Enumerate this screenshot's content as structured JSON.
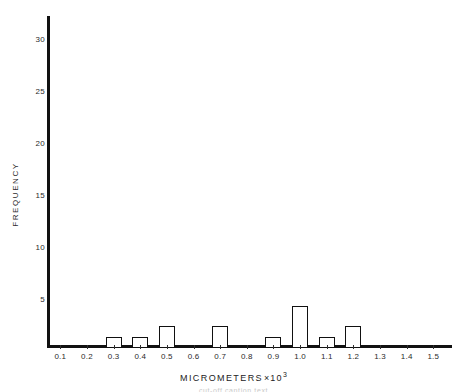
{
  "chart_data": {
    "type": "bar",
    "title": "",
    "subtitle": "",
    "xlabel": "MICROMETERS",
    "xlabel_multiplier": "×",
    "xlabel_exponent_base": "10",
    "xlabel_exponent": "3",
    "ylabel": "FREQUENCY",
    "categories": [
      "0.1",
      "0.2",
      "0.3",
      "0.4",
      "0.5",
      "0.6",
      "0.7",
      "0.8",
      "0.9",
      "1.0",
      "1.1",
      "1.2",
      "1.3",
      "1.4",
      "1.5"
    ],
    "values": [
      0,
      0,
      1,
      1,
      2,
      0,
      2,
      0,
      1,
      4,
      1,
      2,
      0,
      0,
      0
    ],
    "xlim": [
      0.05,
      1.57
    ],
    "ylim": [
      0,
      32
    ],
    "yticks": [
      5,
      10,
      15,
      20,
      25,
      30
    ],
    "ytick_labels": [
      "5",
      "10",
      "15",
      "20",
      "25",
      "30"
    ],
    "xticks": [
      0.1,
      0.2,
      0.3,
      0.4,
      0.5,
      0.6,
      0.7,
      0.8,
      0.9,
      1.0,
      1.1,
      1.2,
      1.3,
      1.4,
      1.5
    ],
    "grid": false,
    "legend": null,
    "bar_fill": "#ffffff",
    "bar_edge": "#111111",
    "axis_color": "#111111",
    "text_color": "#2b2b2b",
    "background": "#ffffff",
    "annotations": []
  },
  "caption": {
    "text": "cut-off caption text"
  }
}
